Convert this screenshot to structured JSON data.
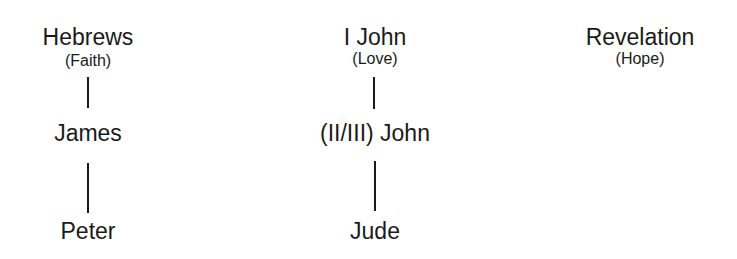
{
  "diagram": {
    "columns": [
      {
        "head": {
          "title": "Hebrews",
          "subtitle": "(Faith)"
        },
        "nodes": [
          "James",
          "Peter"
        ]
      },
      {
        "head": {
          "title": "I John",
          "subtitle": "(Love)"
        },
        "nodes": [
          "(II/III) John",
          "Jude"
        ]
      },
      {
        "head": {
          "title": "Revelation",
          "subtitle": "(Hope)"
        },
        "nodes": []
      }
    ],
    "connectors": [
      {
        "from": "Hebrews",
        "to": "James"
      },
      {
        "from": "James",
        "to": "Peter"
      },
      {
        "from": "I John",
        "to": "(II/III) John"
      },
      {
        "from": "(II/III) John",
        "to": "Jude"
      }
    ],
    "colors": {
      "text": "#1a1a1a",
      "background": "#ffffff"
    }
  }
}
